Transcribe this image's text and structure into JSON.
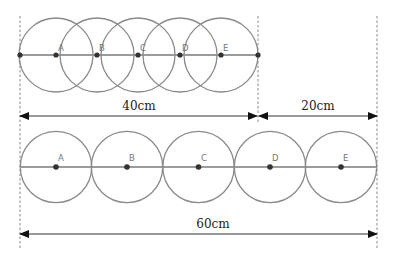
{
  "diagram": {
    "top_row": {
      "labels": [
        "A",
        "B",
        "C",
        "D",
        "E"
      ],
      "description": "Five overlapping circles along a line"
    },
    "bottom_row": {
      "labels": [
        "A",
        "B",
        "C",
        "D",
        "E"
      ],
      "description": "Five tangent circles along a line"
    },
    "measurements": {
      "top_length": "40cm",
      "gap_length": "20cm",
      "bottom_length": "60cm"
    },
    "colors": {
      "circle_stroke": "#8a8a8a",
      "point": "#333333",
      "label": "#777777"
    }
  }
}
